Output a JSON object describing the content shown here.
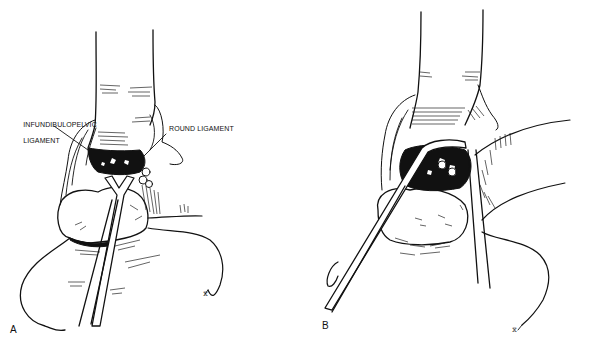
{
  "figure": {
    "panels": [
      {
        "id": "A",
        "letter": "A",
        "labels": {
          "infundibulopelvic_line1": "INFUNDIBULOPELVIC",
          "infundibulopelvic_line2": "LIGAMENT",
          "round_ligament": "ROUND LIGAMENT"
        }
      },
      {
        "id": "B",
        "letter": "B"
      }
    ]
  },
  "colors": {
    "ink": "#111111",
    "background": "#ffffff"
  }
}
